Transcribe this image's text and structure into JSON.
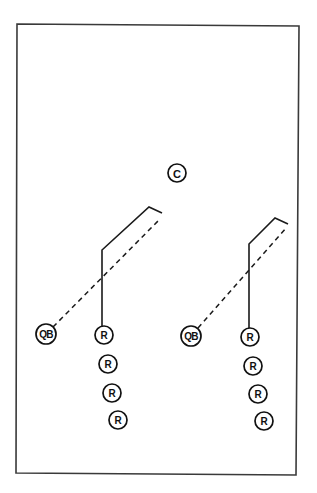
{
  "diagram": {
    "title": "",
    "frame": {
      "points": [
        [
          17,
          24
        ],
        [
          299,
          26
        ],
        [
          296,
          475
        ],
        [
          16,
          473
        ]
      ],
      "stroke": "#3a3a3a"
    },
    "players": [
      {
        "id": "center",
        "label": "C",
        "x": 177,
        "y": 173,
        "r": 9
      },
      {
        "id": "qb-left",
        "label": "QB",
        "x": 46,
        "y": 334,
        "r": 10
      },
      {
        "id": "receiver-left-1",
        "label": "R",
        "x": 104,
        "y": 335,
        "r": 9
      },
      {
        "id": "receiver-left-2",
        "label": "R",
        "x": 108,
        "y": 364,
        "r": 9
      },
      {
        "id": "receiver-left-3",
        "label": "R",
        "x": 112,
        "y": 393,
        "r": 9
      },
      {
        "id": "receiver-left-4",
        "label": "R",
        "x": 118,
        "y": 420,
        "r": 9
      },
      {
        "id": "qb-right",
        "label": "QB",
        "x": 191,
        "y": 336,
        "r": 10
      },
      {
        "id": "receiver-right-1",
        "label": "R",
        "x": 250,
        "y": 337,
        "r": 9
      },
      {
        "id": "receiver-right-2",
        "label": "R",
        "x": 253,
        "y": 366,
        "r": 9
      },
      {
        "id": "receiver-right-3",
        "label": "R",
        "x": 258,
        "y": 394,
        "r": 9
      },
      {
        "id": "receiver-right-4",
        "label": "R",
        "x": 264,
        "y": 421,
        "r": 9
      }
    ],
    "routes": [
      {
        "id": "route-left",
        "type": "solid",
        "points": [
          [
            102,
            326
          ],
          [
            102,
            250
          ],
          [
            149,
            207
          ],
          [
            162,
            213
          ]
        ]
      },
      {
        "id": "route-right",
        "type": "solid",
        "points": [
          [
            249,
            328
          ],
          [
            249,
            244
          ],
          [
            275,
            218
          ],
          [
            288,
            224
          ]
        ]
      }
    ],
    "passes": [
      {
        "id": "pass-left",
        "type": "dashed",
        "from": [
          53,
          327
        ],
        "to": [
          159,
          220
        ]
      },
      {
        "id": "pass-right",
        "type": "dashed",
        "from": [
          198,
          328
        ],
        "to": [
          286,
          228
        ]
      }
    ]
  }
}
